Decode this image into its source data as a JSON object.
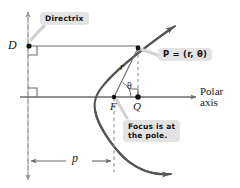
{
  "figure": {
    "type": "geometry-diagram",
    "width": 240,
    "height": 188
  },
  "colors": {
    "curve": "#555555",
    "line": "#6b6b6b",
    "dashed": "#9a9a9a",
    "point": "#111111",
    "callout_bg": "#e3e3e3",
    "text": "#1a1a1a",
    "background": "#ffffff"
  },
  "callouts": {
    "directrix": "Directrix",
    "point": "P = (r, θ)",
    "focus": "Focus is at\nthe pole."
  },
  "callout_focus_lines": {
    "line1": "Focus is at",
    "line2": "the pole."
  },
  "labels": {
    "D": "D",
    "F": "F",
    "Q": "Q",
    "r": "r",
    "theta": "θ",
    "p": "p"
  },
  "axis_label": {
    "line1": "Polar",
    "line2": "axis"
  },
  "points": [
    {
      "name": "D",
      "label": "D",
      "x": 29,
      "y": 46
    },
    {
      "name": "P",
      "label": "P",
      "x": 138,
      "y": 48
    },
    {
      "name": "F",
      "label": "F",
      "x": 114,
      "y": 97
    },
    {
      "name": "Q",
      "label": "Q",
      "x": 138,
      "y": 97
    }
  ],
  "geometry": {
    "directrix_x": 28,
    "polar_axis_y": 97,
    "focus_x": 114,
    "vertex_x": 71,
    "p_distance_label": "p"
  },
  "icons": {
    "arrow": "arrowhead",
    "dot": "filled-dot",
    "right_angle": "right-angle-marker"
  }
}
